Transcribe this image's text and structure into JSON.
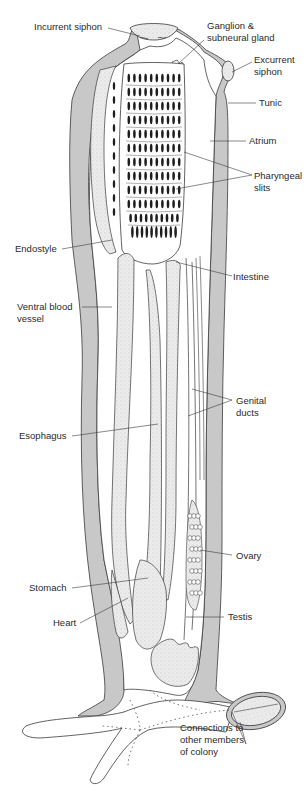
{
  "diagram": {
    "colors": {
      "tunic_fill": "#c8c8c8",
      "stipple_fill": "#e4e4e4",
      "line": "#3a3a3a",
      "slit": "#1e1e1e",
      "background": "#ffffff"
    },
    "labels": {
      "incurrent_siphon": "Incurrent siphon",
      "ganglion": "Ganglion &\nsubneural gland",
      "excurrent_siphon": "Excurrent\nsiphon",
      "tunic": "Tunic",
      "atrium": "Atrium",
      "pharyngeal_slits": "Pharyngeal\nslits",
      "endostyle": "Endostyle",
      "intestine": "Intestine",
      "ventral_blood_vessel": "Ventral blood\nvessel",
      "genital_ducts": "Genital\nducts",
      "esophagus": "Esophagus",
      "ovary": "Ovary",
      "stomach": "Stomach",
      "heart": "Heart",
      "testis": "Testis",
      "connections": "Connections to\nother members\nof colony"
    }
  }
}
